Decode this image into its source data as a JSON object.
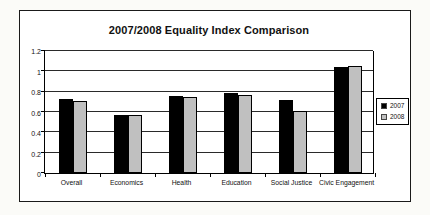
{
  "chart_data": {
    "type": "bar",
    "title": "2007/2008 Equality Index Comparison",
    "categories": [
      "Overall",
      "Economics",
      "Health",
      "Education",
      "Social Justice",
      "Civic Engagement"
    ],
    "series": [
      {
        "name": "2007",
        "color": "#000000",
        "values": [
          0.73,
          0.57,
          0.76,
          0.79,
          0.72,
          1.04
        ]
      },
      {
        "name": "2008",
        "color": "#c0c0c0",
        "values": [
          0.71,
          0.57,
          0.75,
          0.77,
          0.61,
          1.05
        ]
      }
    ],
    "ylim": [
      0,
      1.2
    ],
    "yticks": [
      0,
      0.2,
      0.4,
      0.6,
      0.8,
      1,
      1.2
    ],
    "ytick_labels": [
      "0",
      "0.2",
      "0.4",
      "0.6",
      "0.8",
      "1",
      "1.2"
    ],
    "xlabel": "",
    "ylabel": "",
    "grid": true,
    "legend_position": "right",
    "legend": [
      {
        "label": "2007",
        "color": "#000000"
      },
      {
        "label": "2008",
        "color": "#c0c0c0"
      }
    ]
  },
  "colors": {
    "frame_border": "#1a1a1a",
    "gridline": "#2a2a2a",
    "bar_outline": "#000000",
    "background": "#ffffff"
  }
}
